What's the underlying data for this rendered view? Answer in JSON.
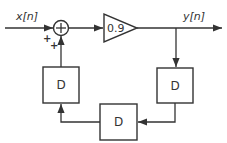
{
  "diagram": {
    "type": "signal-flow block diagram",
    "input_label": "x[n]",
    "output_label": "y[n]",
    "adder": {
      "symbol": "+",
      "input_signs": [
        "+",
        "+"
      ]
    },
    "gain": {
      "value": "0.9"
    },
    "delays": [
      {
        "id": "delay-right",
        "label": "D"
      },
      {
        "id": "delay-bottom",
        "label": "D"
      },
      {
        "id": "delay-left",
        "label": "D"
      }
    ],
    "connections": [
      "x[n] -> adder",
      "adder -> gain 0.9",
      "gain 0.9 -> y[n]",
      "y[n] -> delay-right",
      "delay-right -> delay-bottom",
      "delay-bottom -> delay-left",
      "delay-left -> adder"
    ]
  }
}
